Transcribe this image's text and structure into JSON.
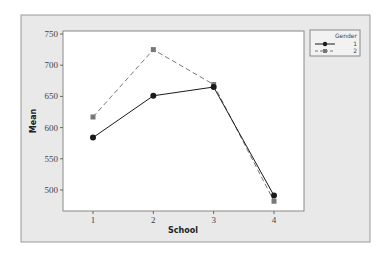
{
  "chart_data": {
    "type": "line",
    "title": "",
    "xlabel": "School",
    "ylabel": "Mean",
    "categories": [
      "1",
      "2",
      "3",
      "4"
    ],
    "x": [
      1,
      2,
      3,
      4
    ],
    "xlim": [
      0.5,
      4.5
    ],
    "ylim": [
      470,
      752
    ],
    "yticks": [
      500,
      550,
      600,
      650,
      700,
      750
    ],
    "grid": false,
    "legend": {
      "title": "Gender",
      "placement": "top-right"
    },
    "series": [
      {
        "name": "1",
        "marker": "circle",
        "linestyle": "solid",
        "color": "#1a1a1a",
        "values": [
          584,
          651,
          665,
          491
        ]
      },
      {
        "name": "2",
        "marker": "square",
        "linestyle": "dashed",
        "color": "#777777",
        "values": [
          617,
          725,
          669,
          482
        ]
      }
    ]
  },
  "colors": {
    "panel_bg": "#e9e9e9",
    "plot_bg": "#ffffff",
    "frame": "#8a8a8a"
  }
}
